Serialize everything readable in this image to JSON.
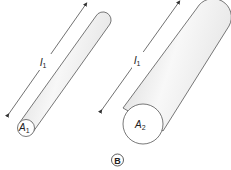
{
  "figure": {
    "panel_label": "B",
    "cylinder_1": {
      "length_label": "l",
      "length_subscript": "1",
      "area_label": "A",
      "area_subscript": "1"
    },
    "cylinder_2": {
      "length_label": "l",
      "length_subscript": "1",
      "area_label": "A",
      "area_subscript": "2"
    },
    "colors": {
      "stroke": "#555555",
      "shade_light": "#ffffff",
      "shade_dark": "#d9d9d9",
      "arrow": "#333333"
    }
  }
}
